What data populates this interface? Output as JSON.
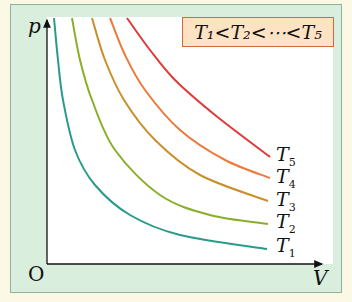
{
  "axes": {
    "y_label": "p",
    "x_label": "V",
    "origin_label": "O"
  },
  "legend": {
    "text": "T₁<T₂<⋯<T₅"
  },
  "curves": [
    {
      "label": "T",
      "sub": "1",
      "color": "#2a9a8a",
      "points": [
        [
          54,
          18
        ],
        [
          58,
          60
        ],
        [
          63,
          100
        ],
        [
          75,
          150
        ],
        [
          95,
          185
        ],
        [
          130,
          215
        ],
        [
          180,
          235
        ],
        [
          267,
          249
        ]
      ],
      "label_pos": [
        276,
        240
      ]
    },
    {
      "label": "T",
      "sub": "2",
      "color": "#8aae2a",
      "points": [
        [
          72,
          18
        ],
        [
          80,
          60
        ],
        [
          92,
          100
        ],
        [
          115,
          150
        ],
        [
          160,
          195
        ],
        [
          210,
          215
        ],
        [
          268,
          224
        ]
      ],
      "label_pos": [
        276,
        216
      ]
    },
    {
      "label": "T",
      "sub": "3",
      "color": "#c8902a",
      "points": [
        [
          92,
          18
        ],
        [
          105,
          60
        ],
        [
          124,
          100
        ],
        [
          155,
          140
        ],
        [
          200,
          175
        ],
        [
          268,
          201
        ]
      ],
      "label_pos": [
        276,
        194
      ]
    },
    {
      "label": "T",
      "sub": "4",
      "color": "#ec7a3a",
      "points": [
        [
          110,
          18
        ],
        [
          125,
          55
        ],
        [
          145,
          90
        ],
        [
          180,
          130
        ],
        [
          225,
          160
        ],
        [
          270,
          178
        ]
      ],
      "label_pos": [
        276,
        171
      ]
    },
    {
      "label": "T",
      "sub": "5",
      "color": "#e03a3a",
      "points": [
        [
          127,
          18
        ],
        [
          150,
          50
        ],
        [
          175,
          80
        ],
        [
          215,
          115
        ],
        [
          270,
          157
        ]
      ],
      "label_pos": [
        276,
        149
      ]
    }
  ],
  "chart_data": {
    "type": "line",
    "xlabel": "V",
    "ylabel": "p",
    "legend": [
      "T1",
      "T2",
      "T3",
      "T4",
      "T5"
    ],
    "annotation": "T1 < T2 < ... < T5",
    "series": [
      {
        "name": "T1",
        "relation": "pV = const (smallest)"
      },
      {
        "name": "T2",
        "relation": "pV = const"
      },
      {
        "name": "T3",
        "relation": "pV = const"
      },
      {
        "name": "T4",
        "relation": "pV = const"
      },
      {
        "name": "T5",
        "relation": "pV = const (largest)"
      }
    ],
    "grid": false
  }
}
